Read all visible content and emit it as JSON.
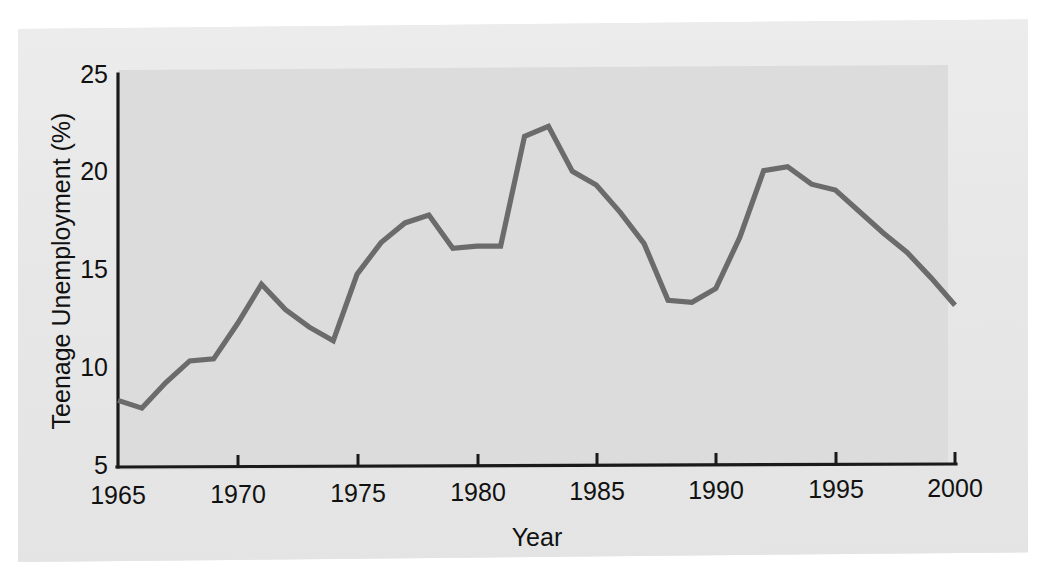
{
  "chart_data": {
    "type": "line",
    "title": "",
    "xlabel": "Year",
    "ylabel": "Teenage Unemployment (%)",
    "xlim": [
      1965,
      2000
    ],
    "ylim": [
      5,
      25
    ],
    "grid": false,
    "legend": "none",
    "xticks": [
      1965,
      1970,
      1975,
      1980,
      1985,
      1990,
      1995,
      2000
    ],
    "xtick_labels": [
      "1965",
      "1970",
      "1975",
      "1980",
      "1985",
      "1990",
      "1995",
      "2000"
    ],
    "yticks": [
      5,
      10,
      15,
      20,
      25
    ],
    "ytick_labels": [
      "5",
      "10",
      "15",
      "20",
      "25"
    ],
    "series": [
      {
        "name": "Teenage Unemployment",
        "color": "#6b6b6b",
        "x": [
          1965,
          1966,
          1967,
          1968,
          1969,
          1970,
          1971,
          1972,
          1973,
          1974,
          1975,
          1976,
          1977,
          1978,
          1979,
          1980,
          1981,
          1982,
          1983,
          1984,
          1985,
          1986,
          1987,
          1988,
          1989,
          1990,
          1991,
          1992,
          1993,
          1994,
          1995,
          1996,
          1997,
          1998,
          1999,
          2000
        ],
        "values": [
          8.4,
          8.0,
          9.3,
          10.4,
          10.5,
          12.3,
          14.3,
          13.0,
          12.1,
          11.4,
          14.8,
          16.4,
          17.4,
          17.8,
          16.1,
          16.2,
          16.2,
          21.8,
          22.3,
          20.0,
          19.3,
          17.9,
          16.3,
          13.4,
          13.3,
          14.0,
          16.6,
          20.0,
          20.2,
          19.3,
          19.0,
          17.9,
          16.8,
          15.8,
          14.5,
          13.1
        ]
      }
    ]
  },
  "axis": {
    "y_title": "Teenage Unemployment (%)",
    "x_title": "Year"
  },
  "colors": {
    "line": "#6b6b6b",
    "axis": "#1a1a1a",
    "panel": "#dcdcdc",
    "page": "#e9e9e9"
  }
}
